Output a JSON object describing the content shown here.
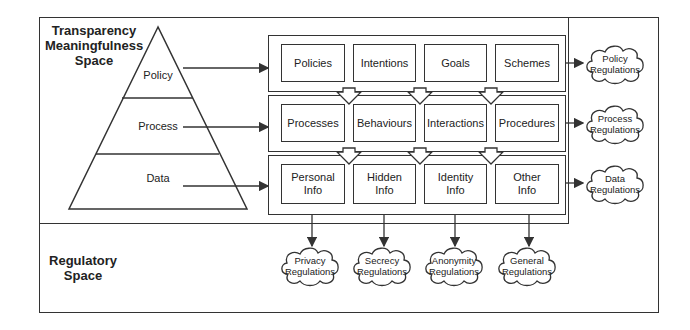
{
  "spaces": {
    "transparency": {
      "title_line1": "Transparency",
      "title_line2": "Meaningfulness",
      "title_line3": "Space"
    },
    "regulatory": {
      "title_line1": "Regulatory",
      "title_line2": "Space"
    }
  },
  "pyramid": {
    "tiers": [
      {
        "label": "Policy"
      },
      {
        "label": "Process"
      },
      {
        "label": "Data"
      }
    ]
  },
  "rows": [
    {
      "name": "policy",
      "cells": [
        {
          "line1": "Policies",
          "line2": ""
        },
        {
          "line1": "Intentions",
          "line2": ""
        },
        {
          "line1": "Goals",
          "line2": ""
        },
        {
          "line1": "Schemes",
          "line2": ""
        }
      ]
    },
    {
      "name": "process",
      "cells": [
        {
          "line1": "Processes",
          "line2": ""
        },
        {
          "line1": "Behaviours",
          "line2": ""
        },
        {
          "line1": "Interactions",
          "line2": ""
        },
        {
          "line1": "Procedures",
          "line2": ""
        }
      ]
    },
    {
      "name": "data",
      "cells": [
        {
          "line1": "Personal",
          "line2": "Info"
        },
        {
          "line1": "Hidden",
          "line2": "Info"
        },
        {
          "line1": "Identity",
          "line2": "Info"
        },
        {
          "line1": "Other",
          "line2": "Info"
        }
      ]
    }
  ],
  "right_clouds": [
    {
      "line1": "Policy",
      "line2": "Regulations"
    },
    {
      "line1": "Process",
      "line2": "Regulations"
    },
    {
      "line1": "Data",
      "line2": "Regulations"
    }
  ],
  "bottom_clouds": [
    {
      "line1": "Privacy",
      "line2": "Regulations"
    },
    {
      "line1": "Secrecy",
      "line2": "Regulations"
    },
    {
      "line1": "Anonymity",
      "line2": "Regulations"
    },
    {
      "line1": "General",
      "line2": "Regulations"
    }
  ],
  "colors": {
    "stroke": "#333333",
    "text": "#222222",
    "background": "#ffffff"
  }
}
